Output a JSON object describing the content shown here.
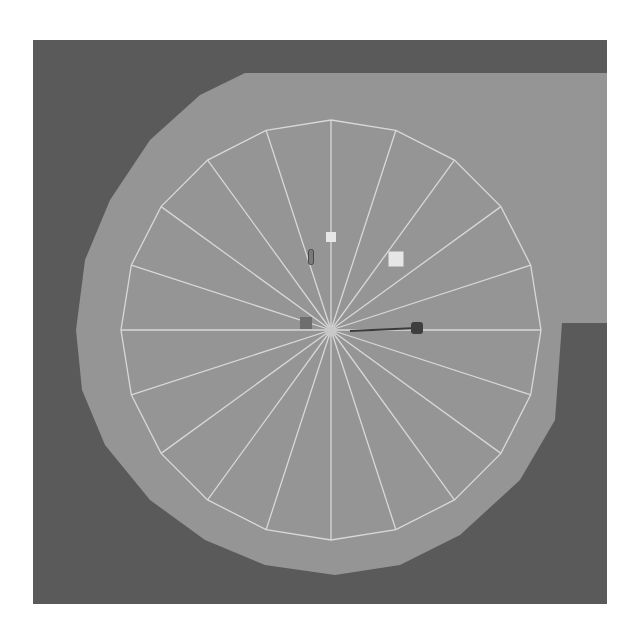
{
  "scene": {
    "view": "top-down",
    "colors": {
      "page_background": "#ffffff",
      "void_background": "#5a5a5a",
      "floor": "#959595",
      "wireframe": "#d8d8d8",
      "light_marker": "#e6e6e6",
      "dark_marker": "#4a4a4a",
      "mid_marker": "#6e6e6e"
    },
    "wireframe_disc": {
      "center": [
        331,
        330
      ],
      "radius": 210,
      "segments": 20
    },
    "objects": [
      {
        "name": "small-light-marker",
        "x": 331,
        "y": 237,
        "size": 10
      },
      {
        "name": "large-light-marker",
        "x": 396,
        "y": 259,
        "size": 15
      },
      {
        "name": "vertical-capsule",
        "x": 311,
        "y": 257,
        "w": 5,
        "h": 15
      },
      {
        "name": "origin-marker",
        "x": 331,
        "y": 331,
        "size": 9
      },
      {
        "name": "dark-square-marker",
        "x": 306,
        "y": 323,
        "size": 12
      },
      {
        "name": "direction-line-end",
        "x": 417,
        "y": 328,
        "size": 12
      }
    ]
  }
}
